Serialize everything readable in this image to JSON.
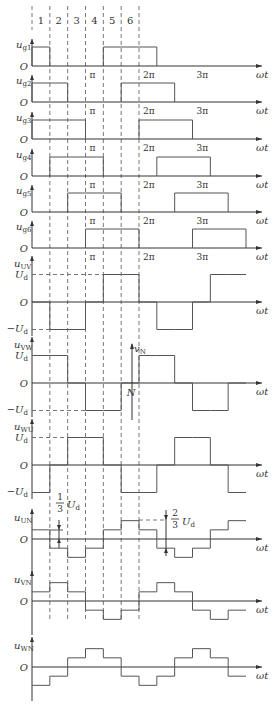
{
  "figure": {
    "segments": [
      "1",
      "2",
      "3",
      "4",
      "5",
      "6"
    ],
    "x_axis_label": "ωt",
    "origin_label": "O",
    "tick_labels": [
      "π",
      "2π",
      "3π"
    ],
    "level_labels": {
      "pos": "U",
      "neg": "−U",
      "sub": "d"
    },
    "annotations": {
      "third": {
        "num": "1",
        "den": "3",
        "text": "U",
        "sub": "d"
      },
      "two_thirds": {
        "num": "2",
        "den": "3",
        "text": "U",
        "sub": "d"
      },
      "neutral_axis": {
        "top": "v",
        "top_sub": "N",
        "bottom": "N"
      }
    }
  },
  "chart_data": {
    "type": "line",
    "title": "",
    "x_unit": "60° segments (period 2π = 6 segments)",
    "x_ticks": [
      "π",
      "2π",
      "3π"
    ],
    "gate_signals": [
      {
        "name": "u_g1",
        "sub": "g1",
        "high_segments": [
          1,
          5,
          6,
          7
        ]
      },
      {
        "name": "u_g2",
        "sub": "g2",
        "high_segments": [
          1,
          2,
          6,
          7,
          8
        ]
      },
      {
        "name": "u_g3",
        "sub": "g3",
        "high_segments": [
          1,
          2,
          3,
          7,
          8,
          9
        ]
      },
      {
        "name": "u_g4",
        "sub": "g4",
        "high_segments": [
          2,
          3,
          4,
          8,
          9,
          10
        ]
      },
      {
        "name": "u_g5",
        "sub": "g5",
        "high_segments": [
          3,
          4,
          5,
          9,
          10,
          11
        ]
      },
      {
        "name": "u_g6",
        "sub": "g6",
        "high_segments": [
          4,
          5,
          6,
          10,
          11,
          12
        ]
      }
    ],
    "line_voltages_in_Ud": [
      {
        "name": "u_UV",
        "sub": "UV",
        "values": [
          0,
          -1,
          -1,
          0,
          1,
          1,
          0,
          -1,
          -1,
          0,
          1,
          1
        ]
      },
      {
        "name": "u_VW",
        "sub": "VW",
        "values": [
          1,
          1,
          0,
          -1,
          -1,
          0,
          1,
          1,
          0,
          -1,
          -1,
          0
        ]
      },
      {
        "name": "u_WU",
        "sub": "WU",
        "values": [
          -1,
          0,
          1,
          1,
          0,
          -1,
          -1,
          0,
          1,
          1,
          0,
          -1
        ]
      }
    ],
    "phase_voltages_in_Ud": [
      {
        "name": "u_UN",
        "sub": "UN",
        "values": [
          0.333,
          -0.333,
          -0.667,
          -0.333,
          0.333,
          0.667,
          0.333,
          -0.333,
          -0.667,
          -0.333,
          0.333,
          0.667
        ]
      },
      {
        "name": "u_VN",
        "sub": "VN",
        "values": [
          0.333,
          0.667,
          0.333,
          -0.333,
          -0.667,
          -0.333,
          0.333,
          0.667,
          0.333,
          -0.333,
          -0.667,
          -0.333
        ]
      },
      {
        "name": "u_WN",
        "sub": "WN",
        "values": [
          -0.667,
          -0.333,
          0.333,
          0.667,
          0.333,
          -0.333,
          -0.667,
          -0.333,
          0.333,
          0.667,
          0.333,
          -0.333
        ]
      }
    ]
  }
}
